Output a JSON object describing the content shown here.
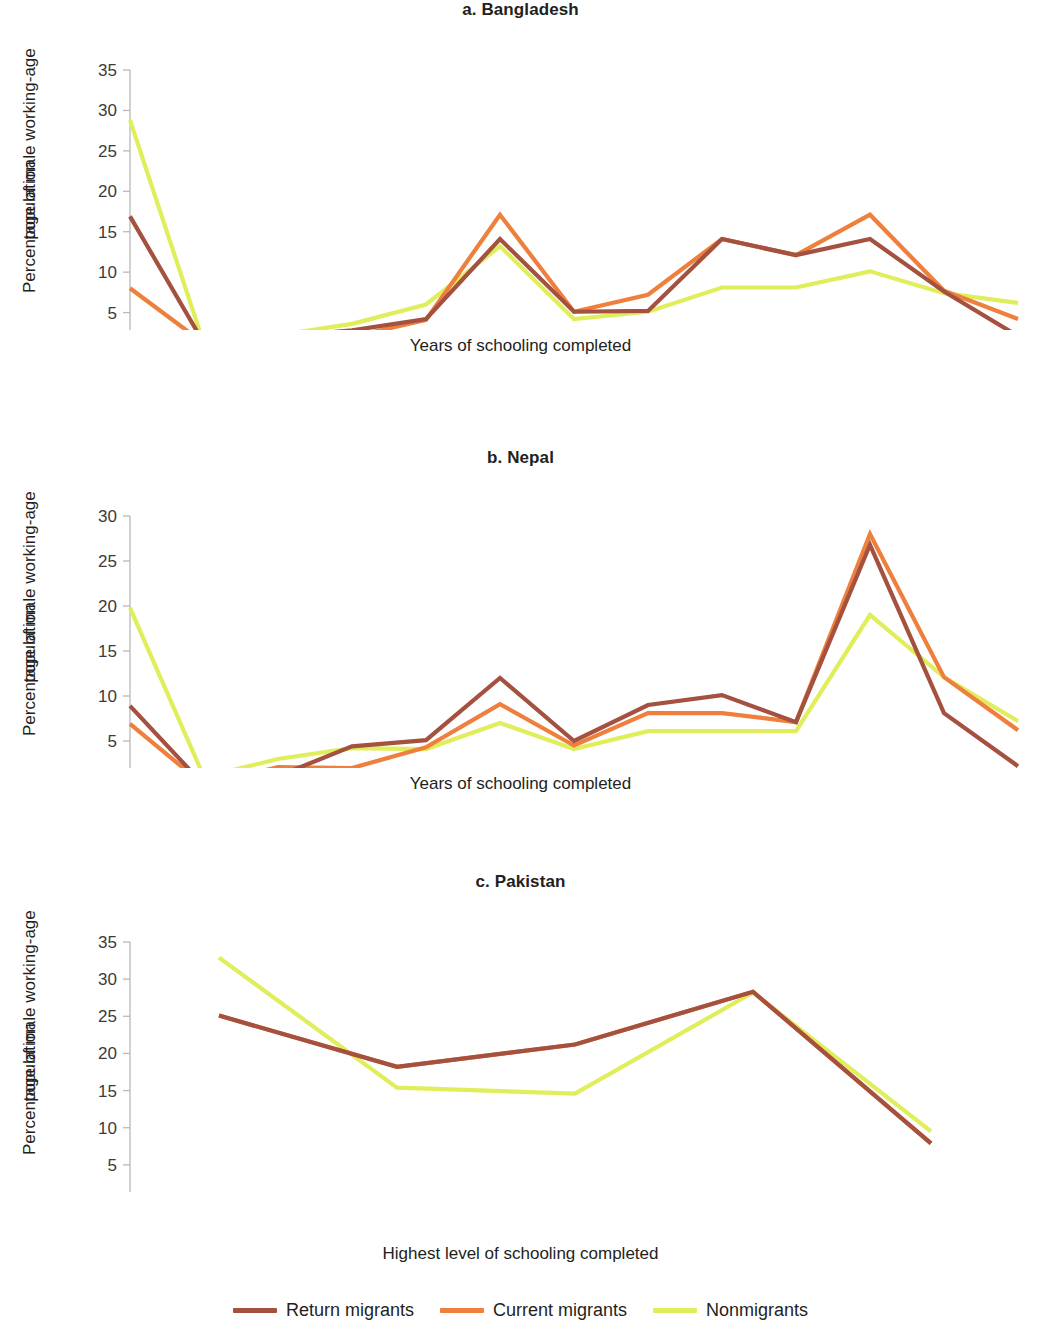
{
  "figure": {
    "y_axis_label_line1": "Percentage of male working-age",
    "y_axis_label_line2": "population"
  },
  "legend": {
    "items": [
      {
        "label": "Return migrants",
        "color": "#a4513f"
      },
      {
        "label": "Current migrants",
        "color": "#ee7f3c"
      },
      {
        "label": "Nonmigrants",
        "color": "#e0ee5c"
      }
    ]
  },
  "panels": [
    {
      "id": "bangladesh",
      "title": "a. Bangladesh",
      "xlabel": "Years of schooling completed"
    },
    {
      "id": "nepal",
      "title": "b. Nepal",
      "xlabel": "Years of schooling completed"
    },
    {
      "id": "pakistan",
      "title": "c. Pakistan",
      "xlabel": "Highest level of schooling completed"
    }
  ],
  "chart_data": [
    {
      "type": "line",
      "title": "a. Bangladesh",
      "xlabel": "Years of schooling completed",
      "ylabel": "Percentage of male working-age population",
      "categories": [
        "0",
        "1",
        "2",
        "3",
        "4",
        "5",
        "6",
        "7",
        "8",
        "9",
        "10",
        "12",
        "16+"
      ],
      "ylim": [
        0,
        35
      ],
      "yticks": [
        0,
        5,
        10,
        15,
        20,
        25,
        30,
        35
      ],
      "grid": false,
      "legend_position": "bottom",
      "series": [
        {
          "name": "Return migrants",
          "color": "#a4513f",
          "values": [
            16.9,
            1.2,
            2.0,
            2.8,
            4.2,
            14.1,
            5.1,
            5.2,
            14.1,
            12.1,
            14.1,
            7.6,
            2.1
          ]
        },
        {
          "name": "Current migrants",
          "color": "#ee7f3c",
          "values": [
            8.0,
            1.2,
            2.0,
            2.0,
            4.1,
            17.1,
            5.1,
            7.2,
            14.1,
            12.1,
            17.1,
            7.7,
            4.2
          ]
        },
        {
          "name": "Nonmigrants",
          "color": "#e0ee5c",
          "values": [
            28.8,
            1.1,
            2.2,
            3.6,
            6.0,
            13.2,
            4.2,
            5.1,
            8.1,
            8.1,
            10.1,
            7.4,
            6.2
          ]
        }
      ]
    },
    {
      "type": "line",
      "title": "b. Nepal",
      "xlabel": "Years of schooling completed",
      "ylabel": "Percentage of male working-age population",
      "categories": [
        "0",
        "1",
        "2",
        "3",
        "4",
        "5",
        "6",
        "7",
        "8",
        "9",
        "10",
        "12",
        "16+"
      ],
      "ylim": [
        0,
        30
      ],
      "yticks": [
        0,
        5,
        10,
        15,
        20,
        25,
        30
      ],
      "grid": false,
      "legend_position": "bottom",
      "series": [
        {
          "name": "Return migrants",
          "color": "#a4513f",
          "values": [
            8.9,
            0.1,
            1.1,
            4.4,
            5.1,
            12.0,
            5.0,
            9.0,
            10.1,
            7.1,
            26.8,
            8.1,
            2.2
          ]
        },
        {
          "name": "Current migrants",
          "color": "#ee7f3c",
          "values": [
            6.9,
            0.1,
            2.1,
            2.0,
            4.3,
            9.1,
            4.5,
            8.1,
            8.1,
            7.1,
            28.0,
            12.1,
            6.2
          ]
        },
        {
          "name": "Nonmigrants",
          "color": "#e0ee5c",
          "values": [
            19.8,
            1.0,
            3.0,
            4.2,
            4.1,
            7.0,
            4.1,
            6.1,
            6.1,
            6.1,
            19.0,
            12.1,
            7.2
          ]
        }
      ]
    },
    {
      "type": "line",
      "title": "c. Pakistan",
      "xlabel": "Highest level of schooling completed",
      "ylabel": "Percentage of male working-age population",
      "categories": [
        "No education",
        "Primary",
        "Lower secondary",
        "Upper secondary",
        "Tertiary"
      ],
      "ylim": [
        0,
        35
      ],
      "yticks": [
        0,
        5,
        10,
        15,
        20,
        25,
        30,
        35
      ],
      "grid": false,
      "legend_position": "bottom",
      "series": [
        {
          "name": "Return migrants",
          "color": "#a4513f",
          "values": [
            25.1,
            18.2,
            21.2,
            28.3,
            7.9
          ]
        },
        {
          "name": "Current migrants",
          "color": "#ee7f3c",
          "values": [
            25.1,
            18.2,
            21.2,
            28.3,
            7.9
          ]
        },
        {
          "name": "Nonmigrants",
          "color": "#e0ee5c",
          "values": [
            32.9,
            15.4,
            14.6,
            28.2,
            9.5
          ]
        }
      ]
    }
  ]
}
